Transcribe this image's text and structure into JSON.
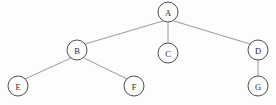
{
  "diagram": {
    "type": "tree",
    "background_color": "#fdfdfc",
    "node_fill_color": "#fdfdfc",
    "node_stroke_color": "#4f4f4f",
    "edge_color": "#9a9a9a",
    "label_color": "#2b2b2b",
    "node_radius": 10,
    "root": "A",
    "nodes": [
      {
        "id": "A",
        "label": "A",
        "cx": 168,
        "cy": 12,
        "r": 10,
        "depth": 0
      },
      {
        "id": "B",
        "label": "B",
        "cx": 77,
        "cy": 50,
        "r": 10,
        "depth": 1
      },
      {
        "id": "C",
        "label": "C",
        "cx": 168,
        "cy": 53,
        "r": 10,
        "depth": 1
      },
      {
        "id": "D",
        "label": "D",
        "cx": 258,
        "cy": 50,
        "r": 10,
        "depth": 1
      },
      {
        "id": "E",
        "label": "E",
        "cx": 18,
        "cy": 86,
        "r": 10,
        "depth": 2
      },
      {
        "id": "F",
        "label": "F",
        "cx": 134,
        "cy": 86,
        "r": 10,
        "depth": 2
      },
      {
        "id": "G",
        "label": "G",
        "cx": 258,
        "cy": 86,
        "r": 10,
        "depth": 2
      }
    ],
    "edges": [
      {
        "id": "A-B",
        "from": "A",
        "to": "B",
        "x1": 163,
        "y1": 21,
        "x2": 85,
        "y2": 44
      },
      {
        "id": "A-C",
        "from": "A",
        "to": "C",
        "x1": 168,
        "y1": 22,
        "x2": 168,
        "y2": 43
      },
      {
        "id": "A-D",
        "from": "A",
        "to": "D",
        "x1": 174,
        "y1": 21,
        "x2": 250,
        "y2": 44
      },
      {
        "id": "B-E",
        "from": "B",
        "to": "E",
        "x1": 71,
        "y1": 58,
        "x2": 25,
        "y2": 79
      },
      {
        "id": "B-F",
        "from": "B",
        "to": "F",
        "x1": 84,
        "y1": 58,
        "x2": 127,
        "y2": 79
      },
      {
        "id": "D-G",
        "from": "D",
        "to": "G",
        "x1": 258,
        "y1": 60,
        "x2": 258,
        "y2": 76
      }
    ]
  }
}
